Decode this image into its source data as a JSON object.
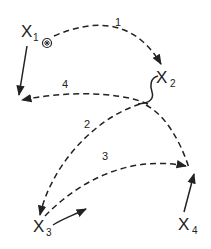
{
  "diagram": {
    "nodes": [
      {
        "id": "x1",
        "label": "X",
        "subscript": "1"
      },
      {
        "id": "x2",
        "label": "X",
        "subscript": "2"
      },
      {
        "id": "x3",
        "label": "X",
        "subscript": "3"
      },
      {
        "id": "x4",
        "label": "X",
        "subscript": "4"
      }
    ],
    "edges": [
      {
        "id": "e1",
        "label": "1",
        "from": "x1",
        "to": "x2",
        "style": "dashed"
      },
      {
        "id": "e2",
        "label": "2",
        "from": "x2",
        "to": "x3",
        "style": "dashed"
      },
      {
        "id": "e3",
        "label": "3",
        "from": "x3",
        "to": "x4",
        "style": "dashed"
      },
      {
        "id": "e4",
        "label": "4",
        "from": "x2",
        "to": "x1",
        "style": "dashed"
      }
    ],
    "marker": {
      "name": "start-marker-icon",
      "glyph": "⊛"
    },
    "colors": {
      "ink": "#222222",
      "background": "#ffffff"
    }
  }
}
